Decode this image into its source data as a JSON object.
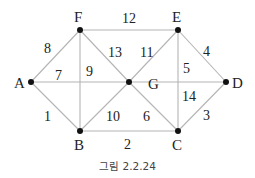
{
  "caption": "그림 2.2.24",
  "nodes": [
    {
      "id": "A",
      "label": "A",
      "x": 31,
      "y": 82,
      "lx": 14,
      "ly": 88
    },
    {
      "id": "F",
      "label": "F",
      "x": 80,
      "y": 30,
      "lx": 74,
      "ly": 22
    },
    {
      "id": "E",
      "label": "E",
      "x": 178,
      "y": 30,
      "lx": 172,
      "ly": 22
    },
    {
      "id": "D",
      "label": "D",
      "x": 226,
      "y": 82,
      "lx": 232,
      "ly": 88
    },
    {
      "id": "G",
      "label": "G",
      "x": 129,
      "y": 82,
      "lx": 148,
      "ly": 89
    },
    {
      "id": "B",
      "label": "B",
      "x": 80,
      "y": 131,
      "lx": 74,
      "ly": 150
    },
    {
      "id": "C",
      "label": "C",
      "x": 178,
      "y": 131,
      "lx": 172,
      "ly": 150
    }
  ],
  "edges": [
    {
      "from": "A",
      "to": "F",
      "weight": "8",
      "lx": 44,
      "ly": 53
    },
    {
      "from": "A",
      "to": "G",
      "weight": "7",
      "lx": 55,
      "ly": 80
    },
    {
      "from": "A",
      "to": "B",
      "weight": "1",
      "lx": 44,
      "ly": 121
    },
    {
      "from": "F",
      "to": "E",
      "weight": "12",
      "lx": 122,
      "ly": 23
    },
    {
      "from": "F",
      "to": "G",
      "weight": "13",
      "lx": 108,
      "ly": 57
    },
    {
      "from": "F",
      "to": "B",
      "weight": "9",
      "lx": 86,
      "ly": 76
    },
    {
      "from": "E",
      "to": "G",
      "weight": "11",
      "lx": 140,
      "ly": 57
    },
    {
      "from": "E",
      "to": "C",
      "weight": "5",
      "lx": 183,
      "ly": 73
    },
    {
      "from": "E",
      "to": "D",
      "weight": "4",
      "lx": 203,
      "ly": 56
    },
    {
      "from": "G",
      "to": "D",
      "weight": "14",
      "lx": 182,
      "ly": 101
    },
    {
      "from": "B",
      "to": "G",
      "weight": "10",
      "lx": 106,
      "ly": 121
    },
    {
      "from": "G",
      "to": "C",
      "weight": "6",
      "lx": 143,
      "ly": 121
    },
    {
      "from": "B",
      "to": "C",
      "weight": "2",
      "lx": 124,
      "ly": 149
    },
    {
      "from": "C",
      "to": "D",
      "weight": "3",
      "lx": 203,
      "ly": 120
    }
  ]
}
